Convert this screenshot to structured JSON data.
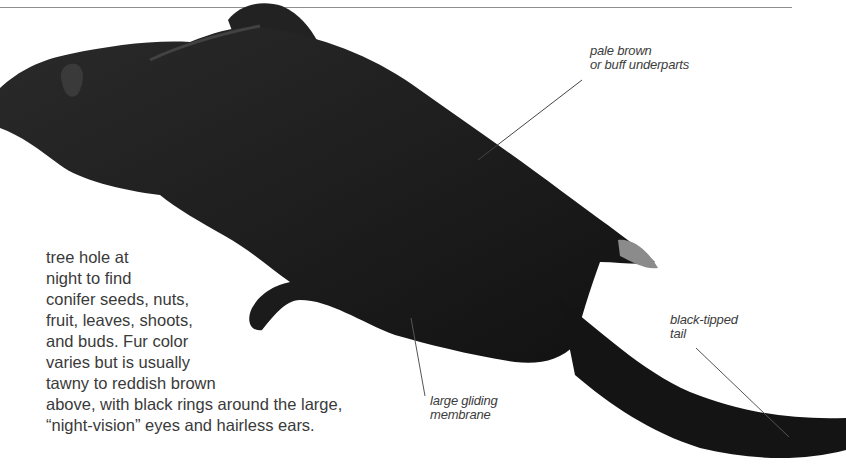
{
  "page": {
    "body_lines": [
      "tree hole at",
      "night to find",
      "conifer seeds, nuts,",
      "fruit, leaves, shoots,",
      "and buds. Fur color",
      "varies but is usually",
      "tawny to reddish brown",
      "above, with black rings around the large,",
      "“night-vision” eyes and hairless ears."
    ],
    "labels": {
      "underparts": [
        "pale brown",
        "or buff underparts"
      ],
      "membrane": [
        "large gliding",
        "membrane"
      ],
      "tail": [
        "black-tipped",
        "tail"
      ]
    },
    "image": {
      "subject": "flying squirrel gliding photo",
      "fur_color": "#1b1b1b"
    }
  }
}
